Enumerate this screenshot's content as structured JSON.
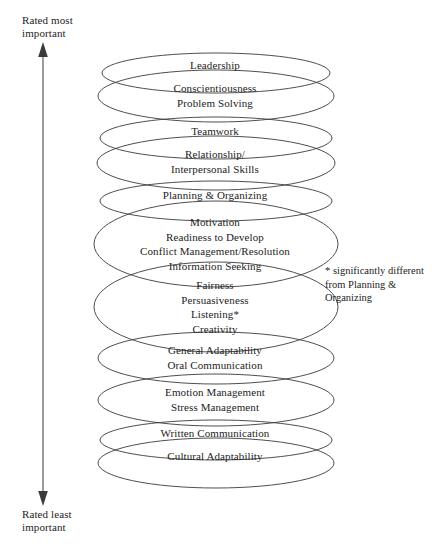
{
  "figure": {
    "axis": {
      "top_label": "Rated most\nimportant",
      "bottom_label": "Rated least\nimportant",
      "arrow_direction": "double-headed-vertical"
    },
    "footnote": "*  significantly different from Planning & Organizing",
    "bands": [
      {
        "id": "leadership",
        "top": 58,
        "lines": [
          "Leadership"
        ]
      },
      {
        "id": "conscientiousness",
        "top": 81,
        "lines": [
          "Conscientiousness",
          "Problem Solving"
        ]
      },
      {
        "id": "teamwork",
        "top": 124,
        "lines": [
          "Teamwork"
        ]
      },
      {
        "id": "relationship",
        "top": 147,
        "lines": [
          "Relationship/",
          "Interpersonal Skills"
        ]
      },
      {
        "id": "planning-organizing",
        "top": 188,
        "lines": [
          "Planning & Organizing"
        ]
      },
      {
        "id": "motivation-group",
        "top": 215,
        "lines": [
          "Motivation",
          "Readiness to Develop",
          "Conflict Management/Resolution",
          "Information Seeking"
        ]
      },
      {
        "id": "fairness-group",
        "top": 278,
        "lines": [
          "Fairness",
          "Persuasiveness",
          "Listening*",
          "Creativity"
        ]
      },
      {
        "id": "general-adaptability",
        "top": 343,
        "lines": [
          "General Adaptability",
          "Oral Communication"
        ]
      },
      {
        "id": "emotion-management",
        "top": 385,
        "lines": [
          "Emotion Management",
          "Stress Management"
        ]
      },
      {
        "id": "written-communication",
        "top": 426,
        "lines": [
          "Written Communication"
        ]
      },
      {
        "id": "cultural-adaptability",
        "top": 449,
        "lines": [
          "Cultural Adaptability"
        ]
      }
    ],
    "ellipses": [
      {
        "id": "ellipse-leadership",
        "cx": 216,
        "cy": 73,
        "rx": 114,
        "ry": 20
      },
      {
        "id": "ellipse-conscientiousness",
        "cx": 216,
        "cy": 96,
        "rx": 118,
        "ry": 26
      },
      {
        "id": "ellipse-teamwork",
        "cx": 216,
        "cy": 138,
        "rx": 116,
        "ry": 21
      },
      {
        "id": "ellipse-relationship",
        "cx": 216,
        "cy": 163,
        "rx": 119,
        "ry": 27
      },
      {
        "id": "ellipse-planning",
        "cx": 216,
        "cy": 201,
        "rx": 116,
        "ry": 20
      },
      {
        "id": "ellipse-motivation",
        "cx": 216,
        "cy": 244,
        "rx": 122,
        "ry": 43
      },
      {
        "id": "ellipse-fairness",
        "cx": 216,
        "cy": 307,
        "rx": 122,
        "ry": 45
      },
      {
        "id": "ellipse-general-adaptability",
        "cx": 216,
        "cy": 358,
        "rx": 118,
        "ry": 26
      },
      {
        "id": "ellipse-emotion",
        "cx": 216,
        "cy": 400,
        "rx": 118,
        "ry": 26
      },
      {
        "id": "ellipse-written",
        "cx": 216,
        "cy": 440,
        "rx": 116,
        "ry": 20
      },
      {
        "id": "ellipse-cultural",
        "cx": 216,
        "cy": 463,
        "rx": 118,
        "ry": 25
      }
    ],
    "style": {
      "stroke_color": "#3a3a3a",
      "text_color": "#1c1c1c",
      "background": "#ffffff"
    }
  }
}
